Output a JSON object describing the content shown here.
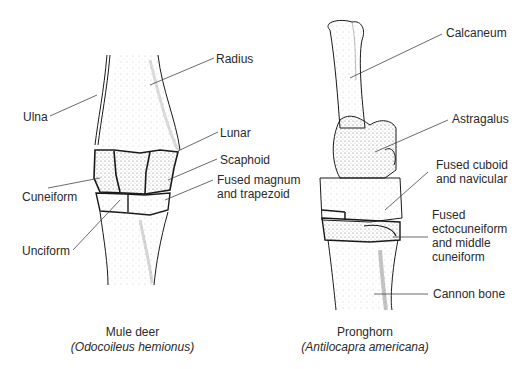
{
  "figures": [
    {
      "id": "mule-deer",
      "common_name": "Mule deer",
      "scientific_name": "(Odocoileus hemionus)",
      "labels": [
        "Ulna",
        "Radius",
        "Lunar",
        "Scaphoid",
        "Fused magnum",
        "and trapezoid",
        "Cuneiform",
        "Unciform"
      ]
    },
    {
      "id": "pronghorn",
      "common_name": "Pronghorn",
      "scientific_name": "(Antilocapra americana)",
      "labels": [
        "Calcaneum",
        "Astragalus",
        "Fused cuboid",
        "and navicular",
        "Fused",
        "ectocuneiform",
        "and middle",
        "cuneiform",
        "Cannon bone"
      ]
    }
  ],
  "colors": {
    "ink": "#1a1a1a",
    "label": "#2a2a2a",
    "background": "#ffffff"
  }
}
